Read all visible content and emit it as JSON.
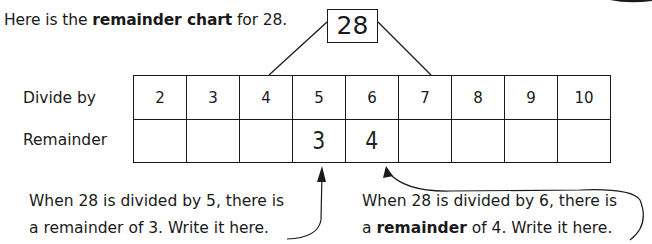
{
  "intro": {
    "prefix": "Here is the ",
    "bold": "remainder chart",
    "suffix": " for 28."
  },
  "dividend": "28",
  "chart": {
    "row_labels": {
      "divide_by": "Divide by",
      "remainder": "Remainder"
    },
    "divisors": [
      "2",
      "3",
      "4",
      "5",
      "6",
      "7",
      "8",
      "9",
      "10"
    ],
    "remainders": [
      "",
      "",
      "",
      "3",
      "4",
      "",
      "",
      "",
      ""
    ]
  },
  "captions": {
    "left": {
      "line1": "When 28 is divided by 5, there is",
      "line2": "a remainder of 3.  Write it here."
    },
    "right": {
      "line1": "When 28 is divided by 6, there is",
      "line2_prefix": "a ",
      "line2_bold": "remainder",
      "line2_suffix": " of 4.  Write it here."
    }
  }
}
